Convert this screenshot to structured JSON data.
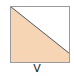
{
  "diagram": {
    "shape": "square-split-by-diagonal",
    "label": "V",
    "colors": {
      "fill": "#f5d5b3",
      "border": "#9a9a9a",
      "diagonal": "#555555",
      "background": "#ffffff"
    }
  }
}
